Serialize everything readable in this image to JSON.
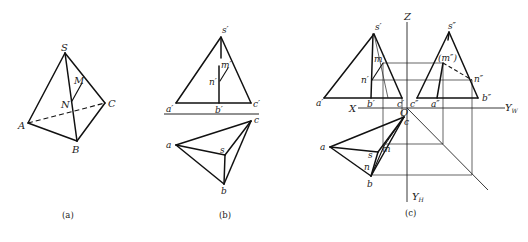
{
  "figure": {
    "panels": [
      {
        "id": "a",
        "caption": "(a)",
        "title": "Pictorial view of triangular pyramid S-ABC",
        "labels": {
          "S": "S",
          "A": "A",
          "B": "B",
          "C": "C",
          "M": "M",
          "N": "N"
        }
      },
      {
        "id": "b",
        "caption": "(b)",
        "title": "Two-view projection (front and top)",
        "labels": {
          "s_front": "s′",
          "a_front": "a′",
          "b_front": "b′",
          "c_front": "c′",
          "m_front": "m′",
          "n_front": "n′",
          "a_top": "a",
          "b_top": "b",
          "c_top": "c",
          "s_top": "s"
        }
      },
      {
        "id": "c",
        "caption": "(c)",
        "title": "Three-view projection with projection axes",
        "axes": {
          "X": "X",
          "Z": "Z",
          "Y_W": "Y",
          "Y_W_sub": "W",
          "Y_H": "Y",
          "Y_H_sub": "H",
          "O": "O"
        },
        "labels": {
          "s_front": "s′",
          "a_front": "a′",
          "b_front": "b′",
          "c_front": "c′",
          "m_front": "m′",
          "n_front": "n′",
          "s_side": "s″",
          "a_side": "a″",
          "b_side": "b″",
          "c_side": "c″",
          "m_side": "(m″)",
          "n_side": "n″",
          "a_top": "a",
          "b_top": "b",
          "c_top": "c",
          "s_top": "s",
          "m_top": "m",
          "n_top": "n"
        }
      }
    ]
  }
}
